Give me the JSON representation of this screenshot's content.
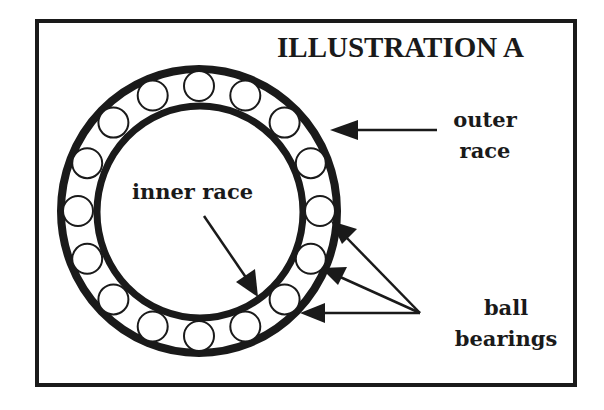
{
  "figure": {
    "title": "ILLUSTRATION A",
    "labels": {
      "outer_race": [
        "outer",
        "race"
      ],
      "inner_race": "inner race",
      "ball_bearings": [
        "ball",
        "bearings"
      ]
    },
    "colors": {
      "ink": "#1a1a1a",
      "background": "#ffffff"
    },
    "geometry": {
      "ball_count": 16,
      "frame": {
        "x": 37,
        "y": 21,
        "width": 538,
        "height": 364
      },
      "outer_ring": {
        "cx": 199,
        "cy": 211,
        "rx": 138,
        "ry": 142,
        "stroke": 8
      },
      "inner_ring": {
        "cx": 200,
        "cy": 212,
        "rx": 103,
        "ry": 106,
        "stroke": 7
      },
      "balls": {
        "cx": 199,
        "cy": 211,
        "rx": 121,
        "ry": 125,
        "r": 15,
        "stroke": 2
      }
    }
  }
}
